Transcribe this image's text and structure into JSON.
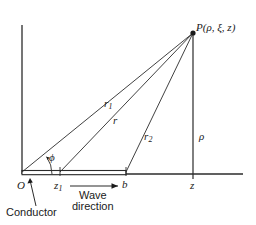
{
  "figure": {
    "type": "geometry-diagram",
    "labels": {
      "point_p": "P(ρ, ξ, z)",
      "r1": "r",
      "r1_sub": "1",
      "r": "r",
      "r2": "r",
      "r2_sub": "2",
      "rho": "ρ",
      "phi": "ϕ",
      "origin": "O",
      "z1": "z",
      "z1_sub": "1",
      "b": "b",
      "z": "z",
      "wave_line1": "Wave",
      "wave_line2": "direction",
      "conductor": "Conductor"
    },
    "colors": {
      "ink": "#1a1a1a",
      "line": "#2b2b2b",
      "background": "#ffffff"
    },
    "geometry": {
      "origin": [
        22,
        174
      ],
      "point_p": [
        193,
        33
      ],
      "z1": [
        60,
        174
      ],
      "b": [
        126,
        174
      ],
      "z": [
        193,
        174
      ],
      "axis_top": [
        22,
        25
      ],
      "baseline_right": [
        243,
        174
      ],
      "conductor_span": [
        22,
        126
      ],
      "phi_arc_radius": 30
    }
  }
}
